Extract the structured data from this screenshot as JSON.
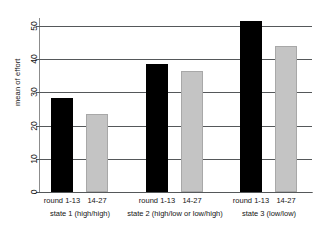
{
  "chart_data": {
    "type": "bar",
    "title": "",
    "xlabel": "",
    "ylabel": "mean of effort",
    "ylim": [
      0,
      53
    ],
    "yticks": [
      0,
      10,
      20,
      30,
      40,
      50
    ],
    "ytick_labels": [
      "0",
      "10",
      "20",
      "30",
      "40",
      "50"
    ],
    "grid": true,
    "legend": "none",
    "categories": [
      "state 1 (high/high)",
      "state 2 (high/low or low/high)",
      "state 3 (low/low)"
    ],
    "subcategories": [
      "round 1-13",
      "14-27"
    ],
    "series": [
      {
        "name": "round 1-13",
        "color": "#000000",
        "values": [
          28.2,
          38.7,
          51.5
        ]
      },
      {
        "name": "14-27",
        "color": "#c4c4c4",
        "values": [
          23.5,
          36.6,
          44.0
        ]
      }
    ],
    "bars": [
      {
        "group": 0,
        "series": 0,
        "label": "round 1-13",
        "value": 28.2,
        "color": "#000000"
      },
      {
        "group": 0,
        "series": 1,
        "label": "14-27",
        "value": 23.5,
        "color": "#c4c4c4"
      },
      {
        "group": 1,
        "series": 0,
        "label": "round 1-13",
        "value": 38.7,
        "color": "#000000"
      },
      {
        "group": 1,
        "series": 1,
        "label": "14-27",
        "value": 36.6,
        "color": "#c4c4c4"
      },
      {
        "group": 2,
        "series": 0,
        "label": "round 1-13",
        "value": 51.5,
        "color": "#000000"
      },
      {
        "group": 2,
        "series": 1,
        "label": "14-27",
        "value": 44.0,
        "color": "#c4c4c4"
      }
    ]
  },
  "axis": {
    "y_title": "mean of effort",
    "ticks": [
      "0",
      "10",
      "20",
      "30",
      "40",
      "50"
    ]
  },
  "x_axis": {
    "round_labels": [
      "round 1-13",
      "14-27",
      "round 1-13",
      "14-27",
      "round 1-13",
      "14-27"
    ],
    "state_labels": [
      "state 1 (high/high)",
      "state 2 (high/low or low/high)",
      "state 3 (low/low)"
    ]
  },
  "colors": {
    "bar_first_half": "#000000",
    "bar_second_half": "#c4c4c4",
    "grid": "#55585a",
    "axis": "#8c8c8c",
    "background": "#ffffff",
    "text": "#141414"
  }
}
